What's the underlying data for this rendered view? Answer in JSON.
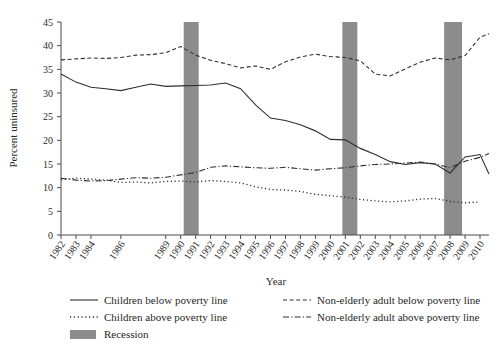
{
  "chart_data": {
    "type": "line",
    "title": "",
    "xlabel": "Year",
    "ylabel": "Percent uninsured",
    "ylim": [
      0,
      45
    ],
    "yticks": [
      0,
      5,
      10,
      15,
      20,
      25,
      30,
      35,
      40,
      45
    ],
    "grid": false,
    "legend_position": "bottom",
    "x": [
      1982,
      1983,
      1984,
      1985,
      1986,
      1987,
      1988,
      1989,
      1990,
      1991,
      1992,
      1993,
      1994,
      1995,
      1996,
      1997,
      1998,
      1999,
      2000,
      2001,
      2002,
      2003,
      2004,
      2005,
      2006,
      2007,
      2008,
      2009,
      2010
    ],
    "xtick_labels": [
      "1982",
      "1983",
      "1984",
      "1986",
      "1989",
      "1990",
      "1991",
      "1992",
      "1993",
      "1994",
      "1995",
      "1996",
      "1997",
      "1998",
      "1999",
      "2000",
      "2001",
      "2002",
      "2003",
      "2004",
      "2005",
      "2006",
      "2007",
      "2008",
      "2009",
      "2010"
    ],
    "series": [
      {
        "name": "Children below poverty line",
        "style": "solid",
        "values": [
          34.0,
          32.3,
          31.2,
          30.9,
          30.5,
          31.2,
          31.9,
          31.4,
          31.5,
          31.6,
          31.7,
          32.1,
          30.9,
          27.5,
          24.7,
          24.2,
          23.3,
          22.0,
          20.2,
          20.1,
          18.3,
          17.0,
          15.5,
          14.9,
          15.3,
          15.0,
          13.1,
          16.5,
          17.0
        ],
        "last_value": 12.9
      },
      {
        "name": "Children above poverty line",
        "style": "dotted",
        "values": [
          11.7,
          12.0,
          11.8,
          11.6,
          11.1,
          11.2,
          11.0,
          11.3,
          11.4,
          11.2,
          11.5,
          11.3,
          11.0,
          10.2,
          9.6,
          9.5,
          9.2,
          8.6,
          8.3,
          8.0,
          7.5,
          7.2,
          7.0,
          7.2,
          7.6,
          7.7,
          7.1,
          6.8,
          7.0
        ]
      },
      {
        "name": "Non-elderly adult below poverty line",
        "style": "dashed",
        "values": [
          37.0,
          37.2,
          37.4,
          37.3,
          37.5,
          38.0,
          38.1,
          38.5,
          39.8,
          38.0,
          36.9,
          36.2,
          35.3,
          35.7,
          35.0,
          36.6,
          37.6,
          38.2,
          37.7,
          37.5,
          36.8,
          34.0,
          33.6,
          35.1,
          36.5,
          37.4,
          37.0,
          37.9,
          41.8
        ],
        "last_value": 42.5
      },
      {
        "name": "Non-elderly adult above poverty line",
        "style": "dashdot",
        "values": [
          12.0,
          11.6,
          11.4,
          11.5,
          11.8,
          12.1,
          12.0,
          12.2,
          12.7,
          13.2,
          14.3,
          14.6,
          14.4,
          14.2,
          14.1,
          14.3,
          14.0,
          13.7,
          14.0,
          14.2,
          14.6,
          14.9,
          15.0,
          15.2,
          15.4,
          15.0,
          14.2,
          15.6,
          16.4
        ],
        "last_value": 17.2
      }
    ],
    "recessions": [
      {
        "label": "Recession",
        "start": 1990.2,
        "end": 1991.2
      },
      {
        "label": "Recession",
        "start": 2000.8,
        "end": 2001.8
      },
      {
        "label": "Recession",
        "start": 2007.6,
        "end": 2008.8
      }
    ]
  },
  "legend": {
    "items": [
      {
        "label": "Children below poverty line",
        "style": "solid"
      },
      {
        "label": "Non-elderly adult below poverty line",
        "style": "dashed"
      },
      {
        "label": "Children above poverty line",
        "style": "dotted"
      },
      {
        "label": "Non-elderly adult above poverty line",
        "style": "dashdot"
      },
      {
        "label": "Recession",
        "style": "patch"
      }
    ]
  },
  "colors": {
    "line": "#2e2e2e",
    "recession": "#8c8c8c",
    "axis": "#4a4a4a",
    "background": "#ffffff"
  }
}
